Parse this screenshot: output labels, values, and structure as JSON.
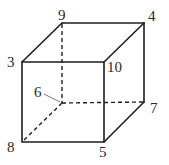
{
  "diagram": {
    "type": "cube",
    "vertices": [
      {
        "id": "9",
        "label": "9",
        "position": "top-back-left"
      },
      {
        "id": "4",
        "label": "4",
        "position": "top-back-right"
      },
      {
        "id": "3",
        "label": "3",
        "position": "top-front-left"
      },
      {
        "id": "10",
        "label": "10",
        "position": "top-front-right"
      },
      {
        "id": "6",
        "label": "6",
        "position": "bottom-back-left (hidden)"
      },
      {
        "id": "7",
        "label": "7",
        "position": "bottom-back-right"
      },
      {
        "id": "8",
        "label": "8",
        "position": "bottom-front-left"
      },
      {
        "id": "5",
        "label": "5",
        "position": "bottom-front-right"
      }
    ],
    "edges_solid": [
      [
        "3",
        "10"
      ],
      [
        "10",
        "5"
      ],
      [
        "5",
        "8"
      ],
      [
        "8",
        "3"
      ],
      [
        "3",
        "9"
      ],
      [
        "9",
        "4"
      ],
      [
        "4",
        "10"
      ],
      [
        "4",
        "7"
      ],
      [
        "7",
        "5"
      ]
    ],
    "edges_hidden": [
      [
        "9",
        "6"
      ],
      [
        "6",
        "7"
      ],
      [
        "6",
        "8"
      ]
    ],
    "colors": {
      "stroke": "#1e1e1e",
      "label": "#2a2a2a",
      "background": "#ffffff"
    }
  }
}
